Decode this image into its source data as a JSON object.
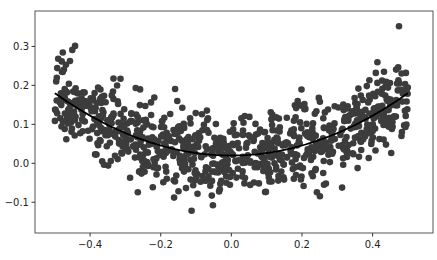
{
  "chart_data": {
    "type": "scatter",
    "title": "",
    "xlabel": "",
    "ylabel": "",
    "xlim": [
      -0.556,
      0.571
    ],
    "ylim": [
      -0.179,
      0.391
    ],
    "grid": false,
    "legend": null,
    "x_ticks": [
      -0.4,
      -0.2,
      0.0,
      0.2,
      0.4
    ],
    "x_tick_labels": [
      "−0.4",
      "−0.2",
      "0.0",
      "0.2",
      "0.4"
    ],
    "y_ticks": [
      -0.1,
      0.0,
      0.1,
      0.2,
      0.3
    ],
    "y_tick_labels": [
      "−0.1",
      "0.0",
      "0.1",
      "0.2",
      "0.3"
    ],
    "series": [
      {
        "name": "samples",
        "kind": "scatter",
        "color": "#3c3c3c",
        "marker_radius": 3.3,
        "generator": {
          "description": "~900 points, x uniform in [-0.5, 0.5], y = 0.64*x^2 + 0.02 + gaussian noise (sd ~0.05)",
          "n": 900,
          "x_range": [
            -0.5,
            0.5
          ],
          "coef_a": 0.64,
          "coef_c": 0.02,
          "noise_sd": 0.05,
          "seed": 7
        }
      },
      {
        "name": "fit",
        "kind": "line",
        "color": "#000000",
        "line_width": 1.8,
        "x": [
          -0.5,
          -0.4,
          -0.3,
          -0.2,
          -0.1,
          0.0,
          0.1,
          0.2,
          0.3,
          0.4,
          0.5
        ],
        "y": [
          0.18,
          0.122,
          0.078,
          0.046,
          0.026,
          0.02,
          0.026,
          0.046,
          0.078,
          0.122,
          0.18
        ]
      }
    ]
  },
  "layout": {
    "plot_box": {
      "left": 35,
      "top": 11,
      "right": 433,
      "bottom": 233
    },
    "frame_color": "#555555"
  }
}
